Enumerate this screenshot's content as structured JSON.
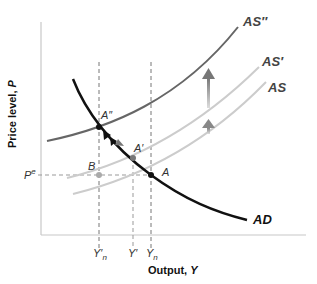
{
  "diagram": {
    "type": "aggregate-supply-aggregate-demand",
    "x_axis": {
      "title": "Output, ",
      "title_var": "Y"
    },
    "y_axis": {
      "title": "Price level, ",
      "title_var": "P"
    },
    "x_ticks": [
      {
        "label": "Y′",
        "sub": "n",
        "x": 99
      },
      {
        "label": "Y′",
        "sub": "",
        "x": 133
      },
      {
        "label": "Y",
        "sub": "n",
        "x": 151
      }
    ],
    "y_ticks": [
      {
        "label": "P",
        "sup": "e",
        "y": 175
      }
    ],
    "curves": [
      {
        "name": "AD",
        "label": "AD",
        "color": "#111111"
      },
      {
        "name": "AS",
        "label": "AS",
        "color": "#cccccc"
      },
      {
        "name": "AS-prime",
        "label": "AS′",
        "color": "#cccccc"
      },
      {
        "name": "AS-double-prime",
        "label": "AS″",
        "color": "#666666"
      }
    ],
    "points": [
      {
        "name": "A",
        "label": "A"
      },
      {
        "name": "A-prime",
        "label": "A′"
      },
      {
        "name": "A-double-prime",
        "label": "A″"
      },
      {
        "name": "B",
        "label": "B"
      }
    ],
    "colors": {
      "ad": "#111111",
      "as_light": "#c8c8c8",
      "as_dark": "#666666",
      "dashed": "#777777",
      "axis": "#c8c8c8",
      "arrow": "#888888"
    }
  }
}
